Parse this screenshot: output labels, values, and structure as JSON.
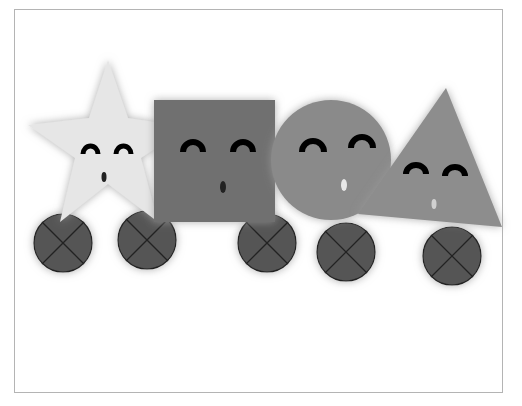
{
  "scene": {
    "description": "Cartoon shapes with smiling faces riding on wheels",
    "colors": {
      "background": "#ffffff",
      "frame_border": "#b4b4b4",
      "star_fill": "#e6e6e6",
      "square_fill": "#6f6f6f",
      "circle_fill": "#8a8a8a",
      "triangle_fill": "#8d8d8d",
      "wheel_fill": "#555555",
      "wheel_stroke": "#222222",
      "eye_color": "#000000"
    },
    "characters": [
      {
        "shape": "star",
        "label": "Star character"
      },
      {
        "shape": "square",
        "label": "Square character"
      },
      {
        "shape": "circle",
        "label": "Circle character"
      },
      {
        "shape": "triangle",
        "label": "Triangle character"
      }
    ],
    "wheels_count": 5
  }
}
